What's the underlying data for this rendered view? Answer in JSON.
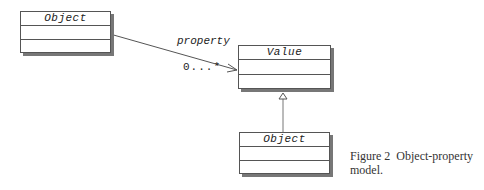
{
  "diagram": {
    "classes": [
      {
        "id": "object-source",
        "name": "Object"
      },
      {
        "id": "value",
        "name": "Value"
      },
      {
        "id": "object-subclass",
        "name": "Object"
      }
    ],
    "association": {
      "role": "property",
      "multiplicity": "0...*"
    },
    "generalization": {
      "from": "Object",
      "to": "Value"
    }
  },
  "caption": {
    "figure": "Figure 2",
    "text": "Object-property",
    "text2": "model."
  }
}
